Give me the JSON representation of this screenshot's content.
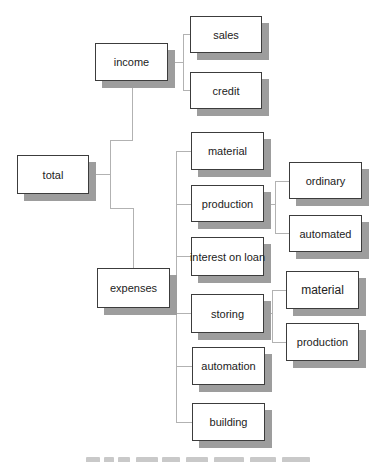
{
  "tree": {
    "label": "total",
    "children": [
      {
        "label": "income",
        "children": [
          {
            "label": "sales"
          },
          {
            "label": "credit"
          }
        ]
      },
      {
        "label": "expenses",
        "children": [
          {
            "label": "material"
          },
          {
            "label": "production",
            "children": [
              {
                "label": "ordinary"
              },
              {
                "label": "automated"
              }
            ]
          },
          {
            "label": "interest on loan"
          },
          {
            "label": "storing",
            "children": [
              {
                "label": "material"
              },
              {
                "label": "production"
              }
            ]
          },
          {
            "label": "automation"
          },
          {
            "label": "building"
          }
        ]
      }
    ]
  },
  "colors": {
    "box_border": "#3c3c3c",
    "box_fill": "#ffffff",
    "shadow": "#9d9d9d",
    "connector": "#b2b2b2",
    "text": "#222222"
  }
}
